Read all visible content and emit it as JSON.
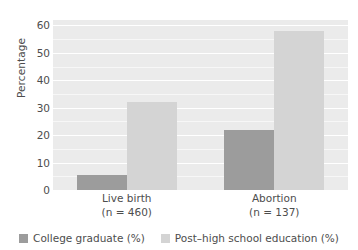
{
  "chart_data": {
    "type": "bar",
    "title": "",
    "subtitle": "",
    "xlabel": "",
    "ylabel": "Percentage",
    "ylim": [
      0,
      62
    ],
    "yticks": [
      0,
      10,
      20,
      30,
      40,
      50,
      60
    ],
    "ytick_labels": [
      "0",
      "10",
      "20",
      "30",
      "40",
      "50",
      "60"
    ],
    "grid": true,
    "grid_color": "#ffffff",
    "panel_background": "#ebebeb",
    "legend_position": "bottom",
    "categories": [
      "Live birth",
      "Abortion"
    ],
    "category_sublabels": [
      "(n = 460)",
      "(n = 137)"
    ],
    "category_counts": [
      460,
      137
    ],
    "series": [
      {
        "name": "College graduate (%)",
        "color": "#9c9c9c",
        "values": [
          5.5,
          22.0
        ]
      },
      {
        "name": "Post–high school education (%)",
        "color": "#d4d4d4",
        "values": [
          32.0,
          58.0
        ]
      }
    ]
  },
  "legend": {
    "items": [
      {
        "label": "College graduate (%)",
        "color": "#9c9c9c",
        "swatch": "square-swatch"
      },
      {
        "label": "Post–high school education (%)",
        "color": "#d4d4d4",
        "swatch": "square-swatch"
      }
    ]
  }
}
